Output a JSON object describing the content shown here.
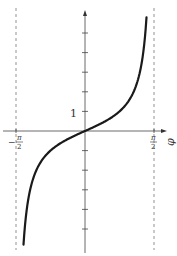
{
  "chart_data": {
    "type": "line",
    "title": "",
    "function": "tan(φ)",
    "xlabel": "φ",
    "ylabel": "",
    "xlim": [
      -1.5708,
      1.5708
    ],
    "ylim": [
      -6.2,
      6.2
    ],
    "x_tick_labels": [
      "−π/2",
      "π/2"
    ],
    "y_tick_labels": [
      "1"
    ],
    "y_ticks": [
      -5,
      -4,
      -3,
      -2,
      -1,
      1,
      2,
      3,
      4,
      5
    ],
    "asymptotes": [
      "x = −π/2",
      "x = π/2"
    ],
    "grid": false,
    "series": [
      {
        "name": "tan φ",
        "x": [
          -1.4,
          -1.3,
          -1.2,
          -1.0,
          -0.8,
          -0.6,
          -0.4,
          -0.2,
          0,
          0.2,
          0.4,
          0.6,
          0.8,
          1.0,
          1.2,
          1.3,
          1.4
        ],
        "values": [
          -5.8,
          -3.6,
          -2.57,
          -1.56,
          -1.03,
          -0.68,
          -0.42,
          -0.2,
          0,
          0.2,
          0.42,
          0.68,
          1.03,
          1.56,
          2.57,
          3.6,
          5.8
        ]
      }
    ]
  },
  "labels": {
    "phi": "φ",
    "one": "1",
    "neg_half_pi_minus": "−",
    "pi": "π",
    "two": "2"
  }
}
